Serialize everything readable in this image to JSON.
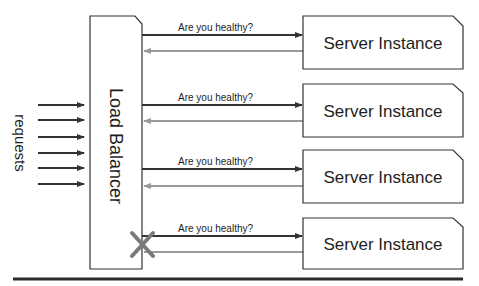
{
  "diagram": {
    "requests_label": "requests",
    "load_balancer_label": "Load Balancer",
    "health_check_label": "Are you healthy?",
    "colors": {
      "stroke": "#333333",
      "response_arrow": "#9a9a9a",
      "failure_cross": "#7a7a7a",
      "background": "#ffffff"
    },
    "request_arrow_count": 6,
    "servers": [
      {
        "label": "Server Instance",
        "health_check": "Are you healthy?",
        "status": "healthy"
      },
      {
        "label": "Server Instance",
        "health_check": "Are you healthy?",
        "status": "healthy"
      },
      {
        "label": "Server Instance",
        "health_check": "Are you healthy?",
        "status": "healthy"
      },
      {
        "label": "Server Instance",
        "health_check": "Are you healthy?",
        "status": "failed"
      }
    ]
  }
}
